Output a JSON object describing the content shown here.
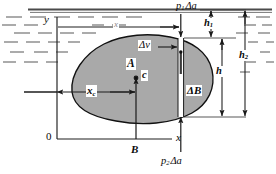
{
  "figure": {
    "type": "physics-diagram",
    "body_fill": "#a8a8a8",
    "body_stroke": "#111111",
    "line_color": "#222222",
    "water_surface_color": "#3a3a3a"
  },
  "labels": {
    "axis_y": "y",
    "axis_x": "x",
    "origin": "0",
    "area": "A",
    "centroid_marker": "c",
    "centroid_distance": "x",
    "centroid_distance_sub": "c",
    "element_volume": "Δv",
    "element_buoyancy": "ΔB",
    "buoyant_force": "B",
    "top_pressure_force": "p",
    "top_pressure_force_sub": "1",
    "top_pressure_force_area": "Δa",
    "bottom_pressure_force": "p",
    "bottom_pressure_force_sub": "2",
    "bottom_pressure_force_area": "Δa",
    "depth_top": "h",
    "depth_top_sub": "1",
    "depth_element": "h",
    "depth_bottom": "h",
    "depth_bottom_sub": "2",
    "horizontal_distance": "x"
  },
  "dimensions": [
    {
      "name": "h1",
      "meaning": "depth from free surface to top of element"
    },
    {
      "name": "h",
      "meaning": "height of the vertical element Δv"
    },
    {
      "name": "h2",
      "meaning": "depth from free surface to bottom of element"
    },
    {
      "name": "xc",
      "meaning": "horizontal distance from y axis to centroid c"
    },
    {
      "name": "x",
      "meaning": "horizontal distance from y axis to element Δa"
    }
  ],
  "forces": [
    {
      "name": "p1 Δa",
      "direction": "down",
      "location": "top of element"
    },
    {
      "name": "p2 Δa",
      "direction": "up",
      "location": "bottom of element"
    },
    {
      "name": "ΔB",
      "direction": "up",
      "location": "element buoyancy"
    },
    {
      "name": "B",
      "direction": "up",
      "location": "total buoyant force at centroid c"
    }
  ]
}
